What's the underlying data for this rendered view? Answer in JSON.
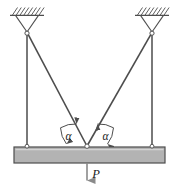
{
  "figure": {
    "background_color": "#ffffff",
    "line_color": "#4d4d4d",
    "beam_fill_color": "#b3b3b3",
    "beam_edge_color": "#4d4d4d",
    "arrow_color": "#808080",
    "labels": {
      "angle_left": "α",
      "angle_right": "α",
      "load": "P"
    },
    "geometry": {
      "support_left": {
        "x": 27,
        "y": 33
      },
      "support_right": {
        "x": 152,
        "y": 33
      },
      "apex": {
        "x": 87,
        "y": 146
      },
      "beam": {
        "x": 14,
        "y": 147,
        "width": 151,
        "height": 16
      },
      "load_arrow": {
        "x": 87,
        "y_start": 163,
        "y_end": 188
      },
      "hatch_left": {
        "x": 10,
        "y": 15,
        "width": 33
      },
      "hatch_right": {
        "x": 135,
        "y": 15,
        "width": 33
      }
    },
    "elements": {
      "ceiling_hatch_left": "hatched-ceiling-icon",
      "ceiling_hatch_right": "hatched-ceiling-icon",
      "pin_left": "pin-joint-icon",
      "pin_right": "pin-joint-icon",
      "rod_left": "vertical-rod",
      "rod_right": "vertical-rod",
      "diagonal_left": "diagonal-bar",
      "diagonal_right": "diagonal-bar",
      "beam": "horizontal-beam",
      "load_arrow": "load-force-arrow",
      "arc_left": "angle-arc",
      "arc_right": "angle-arc"
    }
  }
}
